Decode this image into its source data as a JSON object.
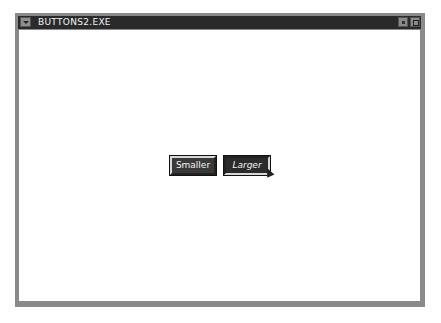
{
  "window": {
    "title": "BUTTONS2.EXE",
    "system_menu_icon": "system-menu-icon",
    "minimize_icon": "minimize-icon",
    "maximize_icon": "maximize-icon"
  },
  "buttons": {
    "smaller_label": "Smaller",
    "larger_label": "Larger"
  },
  "cursor": {
    "icon": "mouse-pointer-icon"
  }
}
